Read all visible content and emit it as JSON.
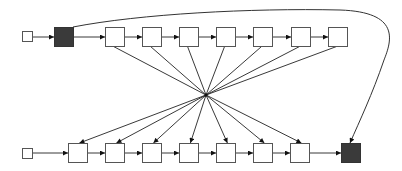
{
  "diagram": {
    "type": "linked-list-reversal",
    "width": 402,
    "height": 171,
    "colors": {
      "background": "#ffffff",
      "node_border": "#555555",
      "dark_node_fill": "#3a3a3a",
      "edge": "#222222"
    },
    "hub": {
      "x": 206,
      "y": 95
    },
    "top_row": {
      "y": 27,
      "size": 19,
      "head": {
        "x": 22,
        "y": 31,
        "size": 10
      },
      "dark_node": {
        "x": 54
      },
      "white_nodes": [
        105,
        142,
        179,
        216,
        253,
        291,
        328
      ]
    },
    "bottom_row": {
      "y": 143,
      "size": 19,
      "head": {
        "x": 22,
        "y": 148,
        "size": 10
      },
      "white_nodes": [
        68,
        105,
        142,
        179,
        216,
        253,
        290
      ],
      "dark_node": {
        "x": 341
      }
    },
    "curve": {
      "path": "M73,27 C140,14 250,8 340,10 C400,12 392,40 384,60 C372,95 360,120 350,143"
    }
  }
}
